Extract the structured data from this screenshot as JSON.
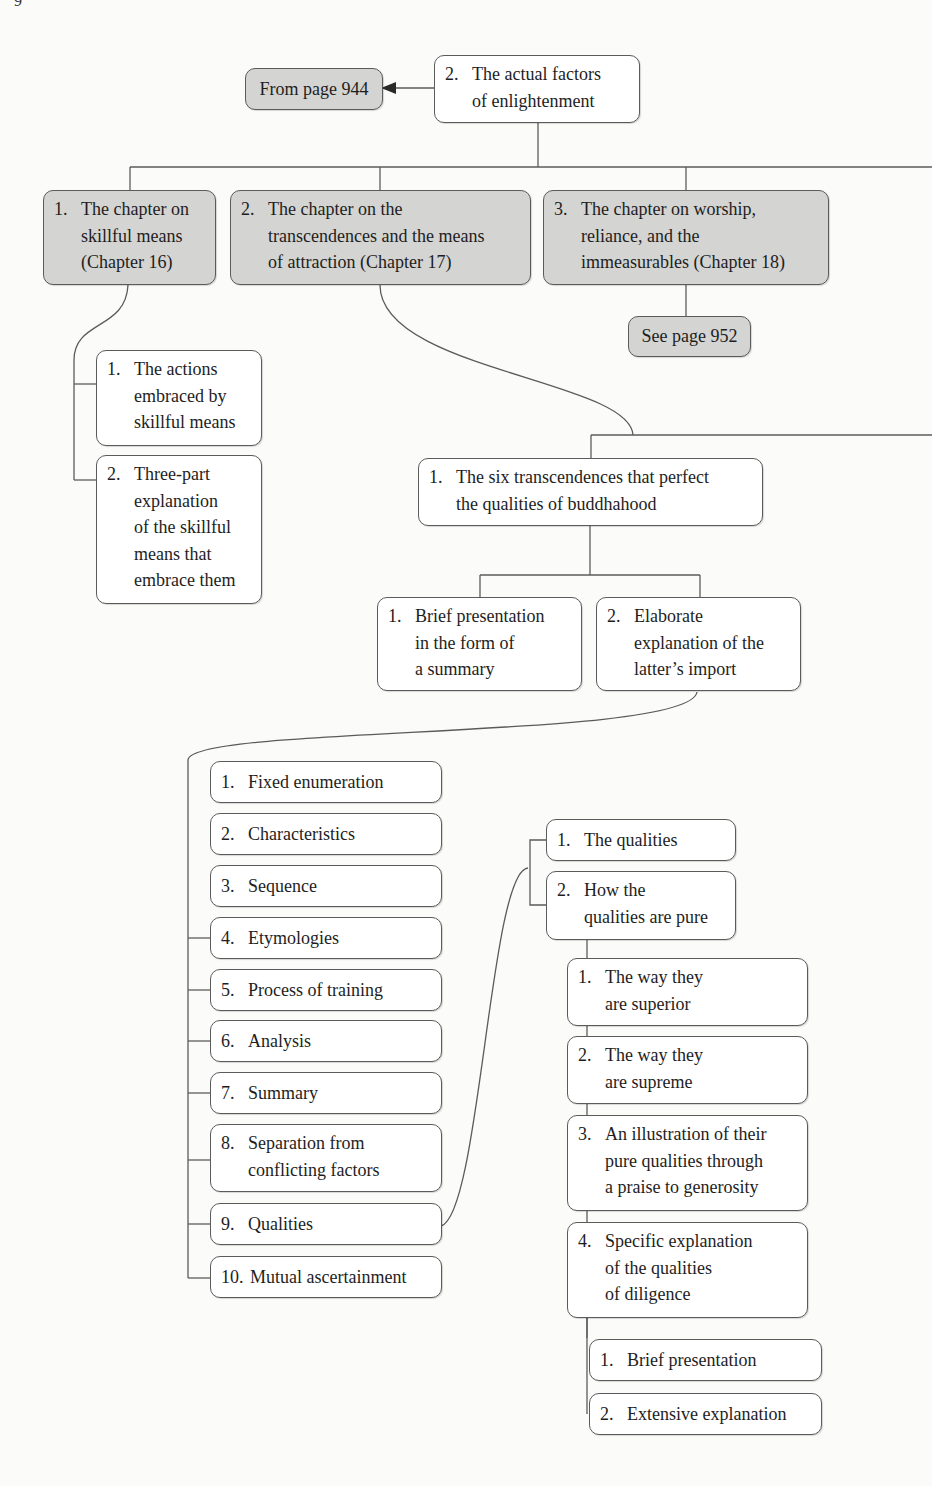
{
  "page_number": "9",
  "root": {
    "num": "2.",
    "text": "The actual factors\nof enlightenment"
  },
  "from_ref": "From page 944",
  "chapters": [
    {
      "num": "1.",
      "text": "The chapter on\nskillful means\n(Chapter 16)"
    },
    {
      "num": "2.",
      "text": "The chapter on the\ntranscendences and the means\nof attraction (Chapter 17)"
    },
    {
      "num": "3.",
      "text": "The chapter on worship,\nreliance, and the\nimmeasurables (Chapter 18)"
    }
  ],
  "see_ref": "See page 952",
  "skillful_means_children": [
    {
      "num": "1.",
      "text": "The actions\nembraced by\nskillful means"
    },
    {
      "num": "2.",
      "text": "Three-part\nexplanation\nof the skillful\nmeans that\nembrace them"
    }
  ],
  "six_transcendences": {
    "num": "1.",
    "text": "The six transcendences that perfect\nthe qualities of buddhahood"
  },
  "transcendence_children": [
    {
      "num": "1.",
      "text": "Brief presentation\nin the form of\na summary"
    },
    {
      "num": "2.",
      "text": "Elaborate\nexplanation of the\nlatter’s import"
    }
  ],
  "elaborate_list": [
    {
      "num": "1.",
      "text": "Fixed enumeration"
    },
    {
      "num": "2.",
      "text": "Characteristics"
    },
    {
      "num": "3.",
      "text": "Sequence"
    },
    {
      "num": "4.",
      "text": "Etymologies"
    },
    {
      "num": "5.",
      "text": "Process of training"
    },
    {
      "num": "6.",
      "text": "Analysis"
    },
    {
      "num": "7.",
      "text": "Summary"
    },
    {
      "num": "8.",
      "text": "Separation from\nconflicting factors"
    },
    {
      "num": "9.",
      "text": "Qualities"
    },
    {
      "num": "10.",
      "text": "Mutual ascertainment"
    }
  ],
  "qualities_children": [
    {
      "num": "1.",
      "text": "The qualities"
    },
    {
      "num": "2.",
      "text": " How the\nqualities are pure"
    }
  ],
  "pure_children": [
    {
      "num": "1.",
      "text": "The way they\nare superior"
    },
    {
      "num": "2.",
      "text": "The way they\nare supreme"
    },
    {
      "num": "3.",
      "text": "An illustration of their\npure qualities through\na praise to generosity"
    },
    {
      "num": "4.",
      "text": "Specific explanation\nof the qualities\nof diligence"
    }
  ],
  "diligence_children": [
    {
      "num": "1.",
      "text": "Brief presentation"
    },
    {
      "num": "2.",
      "text": "Extensive explanation"
    }
  ],
  "colors": {
    "line": "#5b5b5b",
    "gray_box": "#d4d4d2",
    "white_box": "#ffffff",
    "background": "#fbfbf9"
  }
}
